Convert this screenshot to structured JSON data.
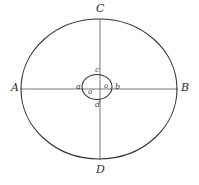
{
  "figure": {
    "background_color": "#ffffff",
    "stroke_color": "#3a3a3a",
    "label_color": "#2e2e2e",
    "width": 199,
    "height": 185
  },
  "outer_ellipse": {
    "name": "outer-ellipse",
    "center_x": 99,
    "center_y": 89,
    "radius_x": 78,
    "radius_y": 70,
    "stroke_width": 1.1
  },
  "inner_ellipse": {
    "name": "inner-ellipse",
    "center_x": 97,
    "center_y": 87,
    "radius_x": 15,
    "radius_y": 12.5,
    "stroke_width": 1.1
  },
  "axes": {
    "horizontal": {
      "x1": 20,
      "y1": 89,
      "x2": 178,
      "y2": 89,
      "stroke_width": 0.8
    },
    "vertical": {
      "x1": 100,
      "y1": 19,
      "x2": 100,
      "y2": 160,
      "stroke_width": 0.8
    }
  },
  "labels": {
    "outer": [
      {
        "id": "A",
        "text": "A",
        "x": 11,
        "y": 82,
        "role": "left-vertex"
      },
      {
        "id": "B",
        "text": "B",
        "x": 181,
        "y": 82,
        "role": "right-vertex"
      },
      {
        "id": "C",
        "text": "C",
        "x": 96,
        "y": 3,
        "role": "top-vertex"
      },
      {
        "id": "D",
        "text": "D",
        "x": 96,
        "y": 164,
        "role": "bottom-vertex"
      }
    ],
    "inner": [
      {
        "id": "a",
        "text": "a",
        "x": 76,
        "y": 83,
        "role": "inner-left-vertex"
      },
      {
        "id": "b",
        "text": "b",
        "x": 115,
        "y": 83,
        "role": "inner-right-vertex"
      },
      {
        "id": "c",
        "text": "c",
        "x": 95,
        "y": 66,
        "role": "inner-top-vertex"
      },
      {
        "id": "d",
        "text": "d",
        "x": 95,
        "y": 101,
        "role": "inner-bottom-vertex"
      }
    ],
    "centers": [
      {
        "id": "o",
        "text": "o",
        "x": 104,
        "y": 83,
        "role": "center-point"
      },
      {
        "id": "o-prime",
        "text": "o′",
        "x": 88,
        "y": 89,
        "role": "secondary-center-point"
      }
    ]
  },
  "caption": {
    "visible_fragment": "",
    "note": ""
  }
}
